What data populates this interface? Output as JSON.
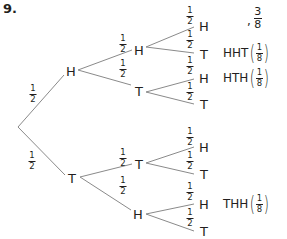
{
  "question_number": "9.",
  "answer": {
    "prefix": ",",
    "numerator": "3",
    "denominator": "8"
  },
  "colors": {
    "line": "#8a8a8a",
    "text": "#231f20"
  },
  "tree": {
    "level1": [
      {
        "label": "H",
        "prob": {
          "num": "1",
          "den": "2"
        }
      },
      {
        "label": "T",
        "prob": {
          "num": "1",
          "den": "2"
        }
      }
    ],
    "level2": [
      {
        "label": "H",
        "parent": "H",
        "prob": {
          "num": "1",
          "den": "2"
        }
      },
      {
        "label": "T",
        "parent": "H",
        "prob": {
          "num": "1",
          "den": "2"
        }
      },
      {
        "label": "T",
        "parent": "T",
        "prob": {
          "num": "1",
          "den": "2"
        }
      },
      {
        "label": "H",
        "parent": "T",
        "prob": {
          "num": "1",
          "den": "2"
        }
      }
    ],
    "level3": [
      {
        "label": "H",
        "prob": {
          "num": "1",
          "den": "2"
        }
      },
      {
        "label": "T",
        "prob": {
          "num": "1",
          "den": "2"
        }
      },
      {
        "label": "H",
        "prob": {
          "num": "1",
          "den": "2"
        }
      },
      {
        "label": "T",
        "prob": {
          "num": "1",
          "den": "2"
        }
      },
      {
        "label": "H",
        "prob": {
          "num": "1",
          "den": "2"
        }
      },
      {
        "label": "T",
        "prob": {
          "num": "1",
          "den": "2"
        }
      },
      {
        "label": "H",
        "prob": {
          "num": "1",
          "den": "2"
        }
      },
      {
        "label": "T",
        "prob": {
          "num": "1",
          "den": "2"
        }
      }
    ]
  },
  "outcomes": [
    {
      "text": "HHT",
      "num": "1",
      "den": "8"
    },
    {
      "text": "HTH",
      "num": "1",
      "den": "8"
    },
    {
      "text": "THH",
      "num": "1",
      "den": "8"
    }
  ]
}
